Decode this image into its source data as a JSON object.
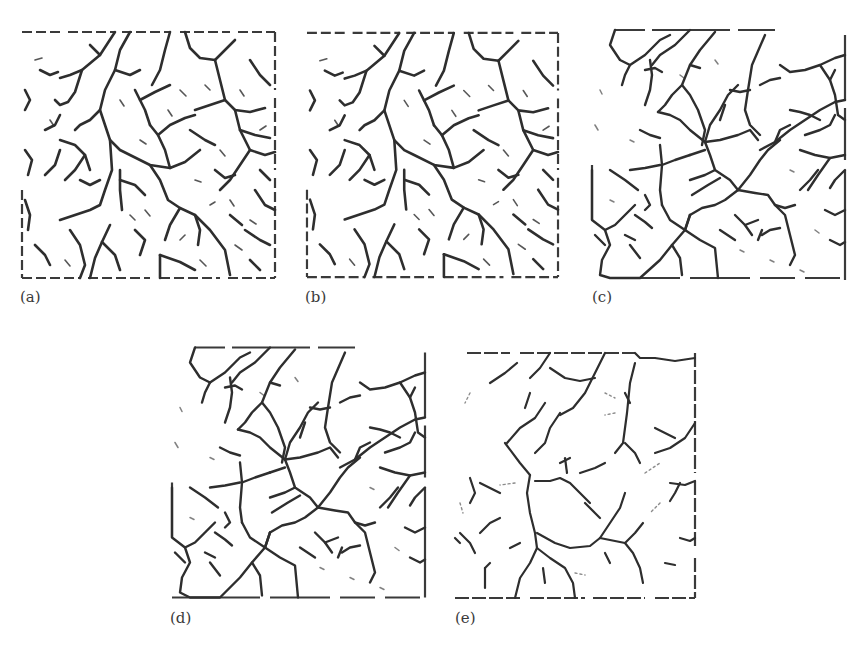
{
  "figure": {
    "panels": [
      {
        "id": "a",
        "label": "(a)",
        "x": 20,
        "y": 30,
        "w": 257,
        "h": 250,
        "density": "dense"
      },
      {
        "id": "b",
        "label": "(b)",
        "x": 305,
        "y": 30,
        "w": 255,
        "h": 250,
        "density": "dense"
      },
      {
        "id": "c",
        "label": "(c)",
        "x": 590,
        "y": 30,
        "w": 255,
        "h": 250,
        "density": "medium"
      },
      {
        "id": "d",
        "label": "(d)",
        "x": 170,
        "y": 345,
        "w": 255,
        "h": 255,
        "density": "medium"
      },
      {
        "id": "e",
        "label": "(e)",
        "x": 455,
        "y": 353,
        "w": 242,
        "h": 245,
        "density": "sparse"
      }
    ],
    "colors": {
      "stroke": "#2e2e2e",
      "label": "#3a3a3a",
      "background": "#ffffff"
    }
  }
}
